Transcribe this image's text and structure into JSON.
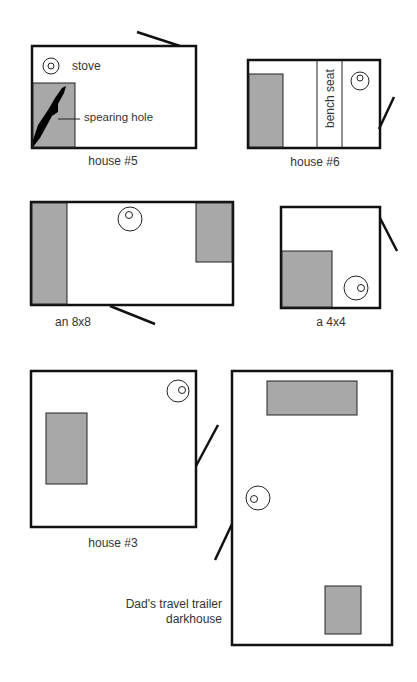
{
  "colors": {
    "wall": "#111111",
    "fill": "#a8a8a8",
    "line": "#222222",
    "text": "#333333"
  },
  "houses": [
    {
      "id": "house5",
      "label": "house #5",
      "annotations": {
        "stove": "stove",
        "hole": "spearing hole"
      }
    },
    {
      "id": "house6",
      "label": "house #6",
      "annotations": {
        "bench": "bench seat"
      }
    },
    {
      "id": "8x8",
      "label": "an 8x8"
    },
    {
      "id": "4x4",
      "label": "a 4x4"
    },
    {
      "id": "house3",
      "label": "house #3"
    },
    {
      "id": "trailer",
      "label_line1": "Dad's travel trailer",
      "label_line2": "darkhouse"
    }
  ]
}
